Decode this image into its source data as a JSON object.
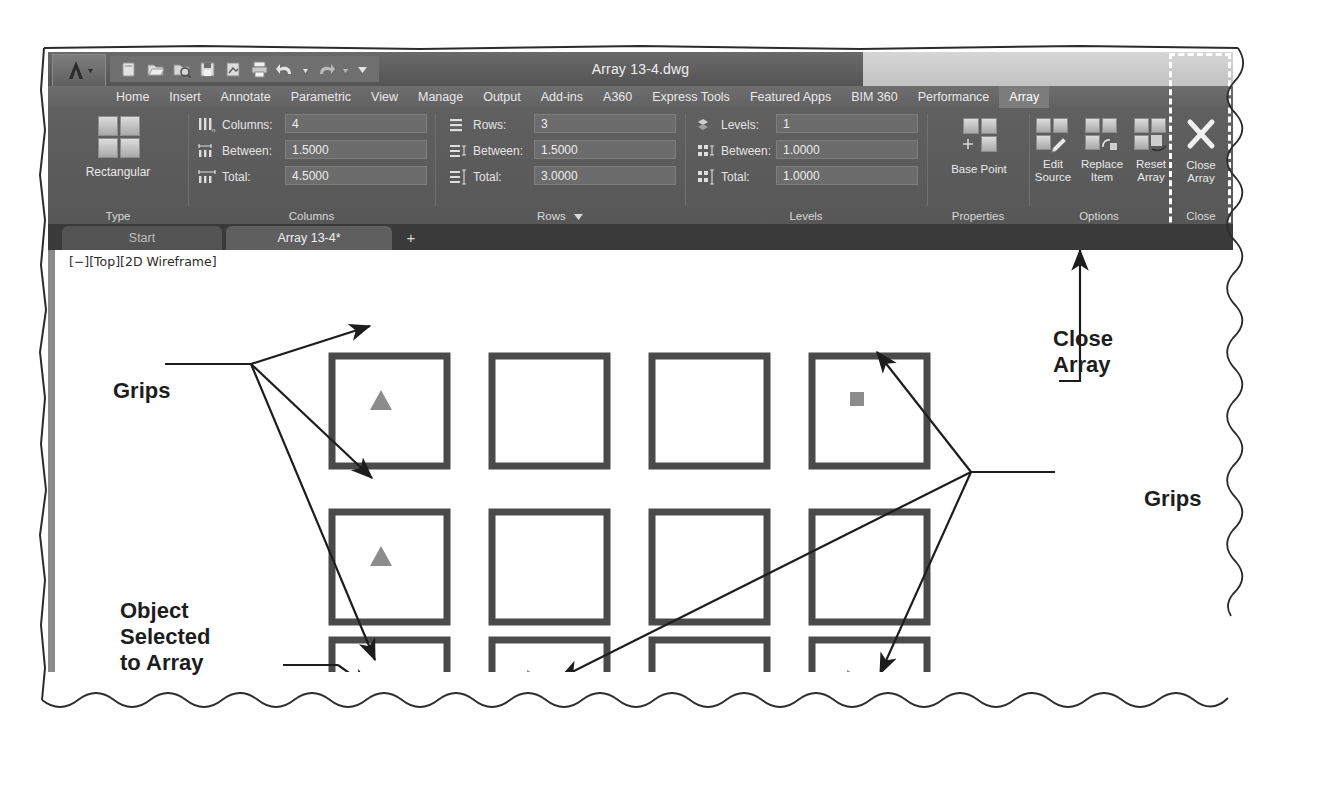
{
  "window": {
    "title": "Array 13-4.dwg",
    "app_menu_icon": "autocad-a-icon",
    "quick_access": [
      {
        "name": "new-icon",
        "label": "New"
      },
      {
        "name": "open-icon",
        "label": "Open"
      },
      {
        "name": "save-as-icon",
        "label": "Save As"
      },
      {
        "name": "save-icon",
        "label": "Save"
      },
      {
        "name": "plot-preview-icon",
        "label": "Plot Preview"
      },
      {
        "name": "plot-icon",
        "label": "Plot"
      },
      {
        "name": "undo-icon",
        "label": "Undo"
      },
      {
        "name": "undo-dropdown-icon",
        "label": "Undo options"
      },
      {
        "name": "redo-icon",
        "label": "Redo"
      },
      {
        "name": "redo-dropdown-icon",
        "label": "Redo options"
      },
      {
        "name": "customize-qat-icon",
        "label": "Customize Quick Access Toolbar"
      }
    ]
  },
  "ribbon": {
    "tabs": [
      {
        "label": "Home",
        "active": false
      },
      {
        "label": "Insert",
        "active": false
      },
      {
        "label": "Annotate",
        "active": false
      },
      {
        "label": "Parametric",
        "active": false
      },
      {
        "label": "View",
        "active": false
      },
      {
        "label": "Manage",
        "active": false
      },
      {
        "label": "Output",
        "active": false
      },
      {
        "label": "Add-ins",
        "active": false
      },
      {
        "label": "A360",
        "active": false
      },
      {
        "label": "Express Tools",
        "active": false
      },
      {
        "label": "Featured Apps",
        "active": false
      },
      {
        "label": "BIM 360",
        "active": false
      },
      {
        "label": "Performance",
        "active": false
      },
      {
        "label": "Array",
        "active": true
      }
    ],
    "panels": {
      "type": {
        "label": "Type",
        "button": {
          "label": "Rectangular",
          "icon": "rectangular-array-icon"
        }
      },
      "columns": {
        "label": "Columns",
        "fields": [
          {
            "label": "Columns:",
            "value": "4",
            "icon": "columns-count-icon"
          },
          {
            "label": "Between:",
            "value": "1.5000",
            "icon": "columns-between-icon"
          },
          {
            "label": "Total:",
            "value": "4.5000",
            "icon": "columns-total-icon"
          }
        ]
      },
      "rows": {
        "label": "Rows",
        "has_dropdown": true,
        "fields": [
          {
            "label": "Rows:",
            "value": "3",
            "icon": "rows-count-icon"
          },
          {
            "label": "Between:",
            "value": "1.5000",
            "icon": "rows-between-icon"
          },
          {
            "label": "Total:",
            "value": "3.0000",
            "icon": "rows-total-icon"
          }
        ]
      },
      "levels": {
        "label": "Levels",
        "fields": [
          {
            "label": "Levels:",
            "value": "1",
            "icon": "levels-count-icon"
          },
          {
            "label": "Between:",
            "value": "1.0000",
            "icon": "levels-between-icon"
          },
          {
            "label": "Total:",
            "value": "1.0000",
            "icon": "levels-total-icon"
          }
        ]
      },
      "properties": {
        "label": "Properties",
        "buttons": [
          {
            "line1": "Base Point",
            "line2": "",
            "icon": "base-point-icon"
          }
        ]
      },
      "options": {
        "label": "Options",
        "buttons": [
          {
            "line1": "Edit",
            "line2": "Source",
            "icon": "edit-source-icon"
          },
          {
            "line1": "Replace",
            "line2": "Item",
            "icon": "replace-item-icon"
          },
          {
            "line1": "Reset",
            "line2": "Array",
            "icon": "reset-array-icon"
          }
        ]
      },
      "close": {
        "label": "Close",
        "buttons": [
          {
            "line1": "Close",
            "line2": "Array",
            "icon": "close-array-icon"
          }
        ],
        "highlighted": true
      }
    }
  },
  "file_tabs": {
    "tabs": [
      {
        "label": "Start",
        "current": false
      },
      {
        "label": "Array 13-4*",
        "current": true
      }
    ],
    "new_tab_label": "+"
  },
  "canvas": {
    "viewport_label": "[−][Top][2D Wireframe]",
    "array": {
      "rows": 3,
      "columns": 4,
      "square_stroke": "#4a4a4a",
      "grip_color": "#8c8c8c"
    },
    "grips": [
      {
        "type": "triangle-up",
        "row": 1,
        "column": 1
      },
      {
        "type": "square",
        "row": 1,
        "column": 4
      },
      {
        "type": "triangle-up",
        "row": 2,
        "column": 1
      },
      {
        "type": "square",
        "row": 3,
        "column": 1
      },
      {
        "type": "triangle-right",
        "row": 3,
        "column": 2
      },
      {
        "type": "triangle-right",
        "row": 3,
        "column": 4
      }
    ]
  },
  "annotations": [
    {
      "name": "grips-label-left",
      "text": "Grips",
      "lines": [
        "Grips"
      ]
    },
    {
      "name": "object-selected-label",
      "text": "Object Selected to Array",
      "lines": [
        "Object",
        "Selected",
        "to Array"
      ]
    },
    {
      "name": "close-array-label",
      "text": "Close Array",
      "lines": [
        "Close",
        "Array"
      ]
    },
    {
      "name": "grips-label-right",
      "text": "Grips",
      "lines": [
        "Grips"
      ]
    }
  ],
  "colors": {
    "ribbon_bg": "#5c5c5c",
    "title_bar": "#595959",
    "canvas_bg": "#ffffff",
    "annotation_text": "#1d1d1d",
    "grip_gray": "#8c8c8c",
    "square_gray": "#4a4a4a"
  }
}
